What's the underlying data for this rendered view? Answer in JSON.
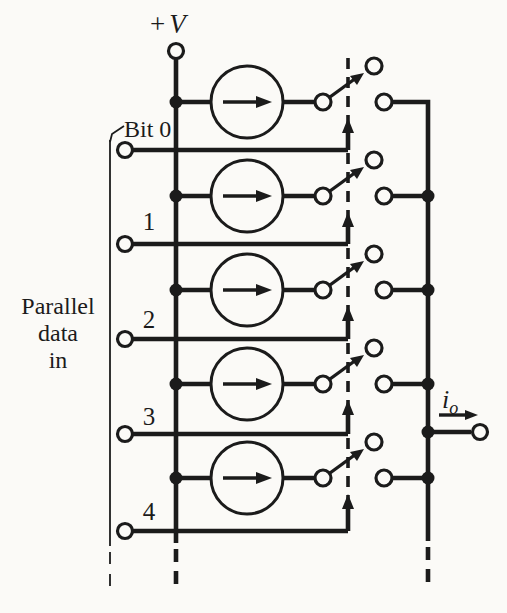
{
  "figure": {
    "supply_label": {
      "sign": "+",
      "symbol": "V"
    },
    "parallel_label": {
      "line1": "Parallel",
      "line2": "data",
      "line3": "in"
    },
    "bit_labels": {
      "b0": "Bit 0",
      "b1": "1",
      "b2": "2",
      "b3": "3",
      "b4": "4"
    },
    "output_label": {
      "symbol": "i",
      "subscript": "o"
    },
    "colors": {
      "ink": "#1b1b1b",
      "paper": "#fbfaf7"
    }
  }
}
